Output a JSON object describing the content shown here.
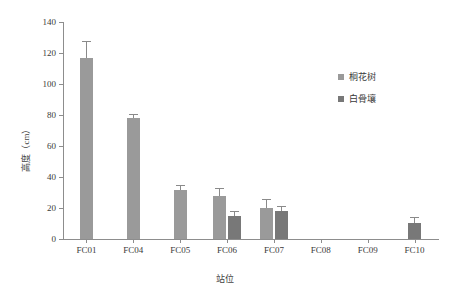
{
  "chart_data": {
    "type": "bar",
    "title": "",
    "subtitle": "",
    "xlabel": "站位",
    "ylabel": "高度（cm）",
    "ylim": [
      0,
      140
    ],
    "ytick_step": 20,
    "ytick_labels": [
      "0",
      "20",
      "40",
      "60",
      "80",
      "100",
      "120",
      "140"
    ],
    "ytick_values": [
      0,
      20,
      40,
      60,
      80,
      100,
      120,
      140
    ],
    "grid": false,
    "legend_position": "upper right",
    "categories": [
      "FC01",
      "FC04",
      "FC05",
      "FC06",
      "FC07",
      "FC08",
      "FC09",
      "FC10"
    ],
    "series": [
      {
        "name": "桐花树",
        "color": "#9a9a9a",
        "values": [
          117,
          78,
          31.5,
          28,
          20,
          null,
          null,
          null
        ],
        "errors": [
          10,
          2,
          3,
          4,
          5,
          null,
          null,
          null
        ]
      },
      {
        "name": "白骨壤",
        "color": "#787878",
        "values": [
          null,
          null,
          null,
          15,
          18,
          null,
          null,
          10.5
        ],
        "errors": [
          null,
          null,
          null,
          2.5,
          2.5,
          null,
          null,
          3
        ]
      }
    ]
  }
}
